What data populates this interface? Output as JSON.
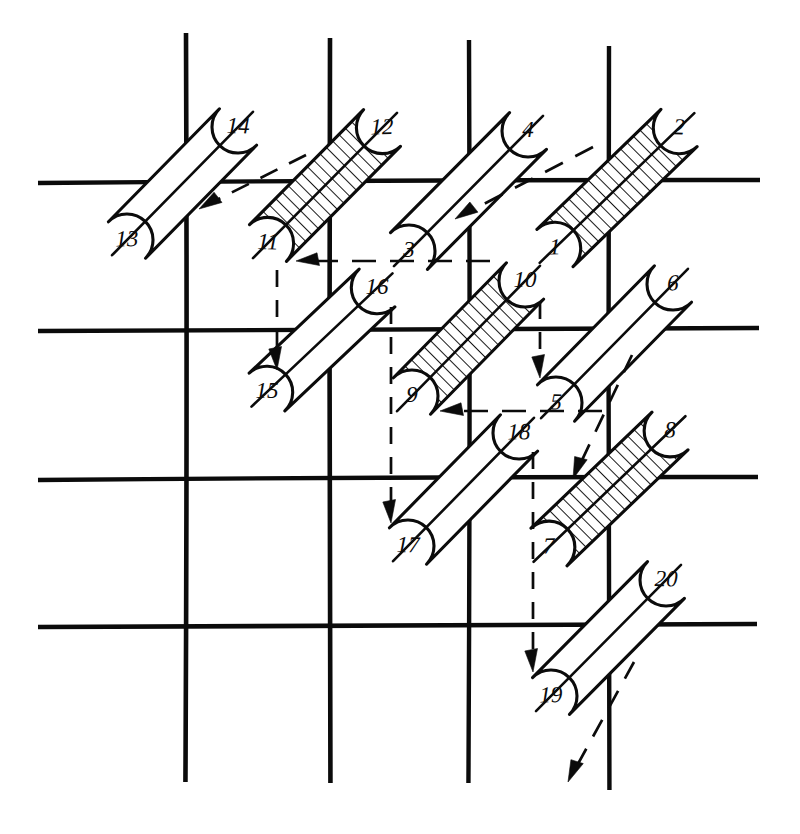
{
  "figure": {
    "ink_color": "#0b0b0b",
    "paper_color": "#ffffff",
    "width": 800,
    "height": 834
  },
  "grid": {
    "vertical_lines": [
      {
        "name": "v1",
        "x": 186,
        "y1": 33,
        "y2": 782,
        "width": 4.6
      },
      {
        "name": "v2",
        "x": 330,
        "y1": 38,
        "y2": 783,
        "width": 4.6
      },
      {
        "name": "v3",
        "x": 469,
        "y1": 40,
        "y2": 783,
        "width": 4.4
      },
      {
        "name": "v4",
        "x": 609,
        "y1": 46,
        "y2": 790,
        "width": 4.4
      }
    ],
    "horizontal_lines": [
      {
        "name": "h1",
        "y": 181,
        "x1": 38,
        "x2": 760,
        "width": 4.4
      },
      {
        "name": "h2",
        "y": 329,
        "x1": 38,
        "x2": 759,
        "width": 4.4
      },
      {
        "name": "h3",
        "y": 478,
        "x1": 38,
        "x2": 758,
        "width": 4.4
      },
      {
        "name": "h4",
        "y": 625,
        "x1": 38,
        "x2": 757,
        "width": 4.6
      }
    ]
  },
  "tiles": [
    {
      "id": "tile-1-2",
      "low_label": "1",
      "high_label": "2",
      "low": {
        "x": 555,
        "y": 248
      },
      "high": {
        "x": 679,
        "y": 128
      },
      "hatched": true
    },
    {
      "id": "tile-3-4",
      "low_label": "3",
      "high_label": "4",
      "low": {
        "x": 409,
        "y": 251
      },
      "high": {
        "x": 528,
        "y": 131
      },
      "hatched": false
    },
    {
      "id": "tile-5-6",
      "low_label": "5",
      "high_label": "6",
      "low": {
        "x": 556,
        "y": 403
      },
      "high": {
        "x": 673,
        "y": 284
      },
      "hatched": false
    },
    {
      "id": "tile-7-8",
      "low_label": "7",
      "high_label": "8",
      "low": {
        "x": 549,
        "y": 547
      },
      "high": {
        "x": 670,
        "y": 431
      },
      "hatched": true
    },
    {
      "id": "tile-9-10",
      "low_label": "9",
      "high_label": "10",
      "low": {
        "x": 412,
        "y": 396
      },
      "high": {
        "x": 525,
        "y": 281
      },
      "hatched": true
    },
    {
      "id": "tile-11-12",
      "low_label": "11",
      "high_label": "12",
      "low": {
        "x": 268,
        "y": 243
      },
      "high": {
        "x": 382,
        "y": 128
      },
      "hatched": true
    },
    {
      "id": "tile-13-14",
      "low_label": "13",
      "high_label": "14",
      "low": {
        "x": 127,
        "y": 240
      },
      "high": {
        "x": 238,
        "y": 127
      },
      "hatched": false
    },
    {
      "id": "tile-15-16",
      "low_label": "15",
      "high_label": "16",
      "low": {
        "x": 267,
        "y": 392
      },
      "high": {
        "x": 377,
        "y": 288
      },
      "hatched": false
    },
    {
      "id": "tile-17-18",
      "low_label": "17",
      "high_label": "18",
      "low": {
        "x": 408,
        "y": 546
      },
      "high": {
        "x": 519,
        "y": 433
      },
      "hatched": false
    },
    {
      "id": "tile-19-20",
      "low_label": "19",
      "high_label": "20",
      "low": {
        "x": 551,
        "y": 696
      },
      "high": {
        "x": 666,
        "y": 580
      },
      "hatched": false
    }
  ],
  "tile_geometry": {
    "half_width": 26,
    "label_offset": 0
  },
  "arrows": [
    {
      "id": "arrow-12-to-13",
      "style": "dashed",
      "orientation": "diagonal",
      "from": {
        "x": 306,
        "y": 155
      },
      "to": {
        "x": 199,
        "y": 209
      },
      "dash": "19 13"
    },
    {
      "id": "arrow-2-to-3",
      "style": "dashed",
      "orientation": "diagonal",
      "from": {
        "x": 593,
        "y": 147
      },
      "to": {
        "x": 455,
        "y": 219
      },
      "dash": "20 14"
    },
    {
      "id": "arrow-1-to-11",
      "style": "dashed",
      "orientation": "horizontal",
      "from": {
        "x": 490,
        "y": 261
      },
      "to": {
        "x": 296,
        "y": 261
      },
      "dash": "24 14"
    },
    {
      "id": "arrow-5-to-9",
      "style": "dashed",
      "orientation": "horizontal",
      "from": {
        "x": 602,
        "y": 411
      },
      "to": {
        "x": 440,
        "y": 411
      },
      "dash": "24 14"
    },
    {
      "id": "arrow-11-to-15",
      "style": "dashed",
      "orientation": "vertical",
      "from": {
        "x": 277,
        "y": 270
      },
      "to": {
        "x": 277,
        "y": 370
      },
      "dash": "17 13"
    },
    {
      "id": "arrow-16-to-17",
      "style": "dashed",
      "orientation": "vertical",
      "from": {
        "x": 391,
        "y": 307
      },
      "to": {
        "x": 391,
        "y": 523
      },
      "dash": "17 13"
    },
    {
      "id": "arrow-10-to-5",
      "style": "dashed",
      "orientation": "vertical",
      "from": {
        "x": 540,
        "y": 302
      },
      "to": {
        "x": 540,
        "y": 378
      },
      "dash": "17 13"
    },
    {
      "id": "arrow-18-to-19",
      "style": "dashed",
      "orientation": "vertical",
      "from": {
        "x": 533,
        "y": 452
      },
      "to": {
        "x": 533,
        "y": 672
      },
      "dash": "17 13"
    },
    {
      "id": "arrow-6-to-7",
      "style": "dashed",
      "orientation": "diagonal",
      "from": {
        "x": 632,
        "y": 355
      },
      "to": {
        "x": 573,
        "y": 479
      },
      "dash": "19 14"
    },
    {
      "id": "arrow-20-out",
      "style": "dashed",
      "orientation": "diagonal",
      "from": {
        "x": 634,
        "y": 662
      },
      "to": {
        "x": 568,
        "y": 782
      },
      "dash": "19 14"
    }
  ],
  "legend": {
    "hatched_meaning": "shaded tile",
    "arrow_meaning": "move direction"
  }
}
